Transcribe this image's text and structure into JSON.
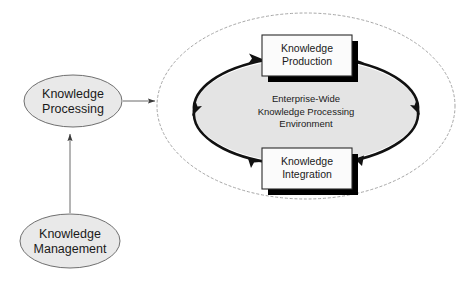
{
  "diagram": {
    "type": "process-cycle-diagram",
    "colors": {
      "ellipse_fill": "#e8e8e8",
      "ellipse_stroke": "#6b6b6b",
      "box_fill": "#fbfbfb",
      "box_stroke": "#2b2b2b",
      "box_shadow": "#000000",
      "cycle_ring_stroke": "#111111",
      "inner_ellipse_fill": "#e3e3e3",
      "dashed_stroke": "#9a9a9a",
      "connector_stroke": "#555555",
      "text": "#1a1a1a",
      "background": "#ffffff"
    },
    "nodes": {
      "knowledge_processing": {
        "label": "Knowledge\nProcessing",
        "shape": "ellipse"
      },
      "knowledge_management": {
        "label": "Knowledge\nManagement",
        "shape": "ellipse"
      },
      "knowledge_production": {
        "label": "Knowledge\nProduction",
        "shape": "rectangle"
      },
      "knowledge_integration": {
        "label": "Knowledge\nIntegration",
        "shape": "rectangle"
      },
      "environment": {
        "label": "Enterprise-Wide\nKnowledge Processing\nEnvironment",
        "shape": "ellipse"
      }
    },
    "connectors": [
      {
        "name": "management-to-processing",
        "from": "knowledge_management",
        "to": "knowledge_processing",
        "direction": "up",
        "style": "solid-thin-arrow"
      },
      {
        "name": "processing-to-environment",
        "from": "knowledge_processing",
        "to": "environment",
        "direction": "right",
        "style": "solid-thin-arrow"
      }
    ],
    "cycle": {
      "name": "knowledge-processing-cycle",
      "direction": "clockwise",
      "arrow_count": 4,
      "stages": [
        "knowledge_production",
        "knowledge_integration"
      ]
    },
    "boundary": {
      "name": "enterprise-boundary",
      "style": "dashed-ellipse"
    }
  }
}
